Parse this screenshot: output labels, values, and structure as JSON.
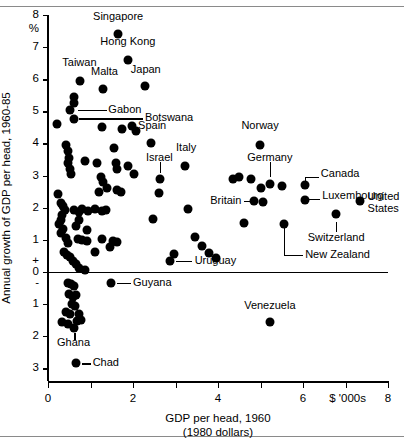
{
  "chart_data": {
    "type": "scatter",
    "title": "",
    "xlabel": "GDP per head, 1960",
    "xlabel_sub": "(1980 dollars)",
    "ylabel": "Annual growth of GDP per head, 1960-85",
    "y_unit": "%",
    "x_unit": "$ '000s",
    "xlim": [
      0,
      8
    ],
    "ylim": [
      -3.4,
      8
    ],
    "xticks": [
      0,
      1,
      2,
      3,
      4,
      5,
      6,
      7,
      8
    ],
    "xtick_labels": [
      "0",
      "",
      "2",
      "",
      "4",
      "",
      "6",
      "",
      "8"
    ],
    "yticks": [
      8,
      7,
      6,
      5,
      4,
      3,
      2,
      1,
      0.35,
      0,
      -0.35,
      -1,
      -2,
      -3
    ],
    "ytick_labels": [
      "8",
      "7",
      "6",
      "5",
      "4",
      "3",
      "2",
      "1",
      "+",
      "0",
      "-",
      "1",
      "2",
      "3"
    ],
    "grid": false,
    "legend": null,
    "zero_line": true,
    "labeled_points": [
      {
        "name": "Singapore",
        "x": 1.65,
        "y": 7.4
      },
      {
        "name": "Hong Kong",
        "x": 1.88,
        "y": 6.6
      },
      {
        "name": "Japan",
        "x": 2.28,
        "y": 5.8
      },
      {
        "name": "Taiwan",
        "x": 0.75,
        "y": 5.95
      },
      {
        "name": "Malta",
        "x": 1.3,
        "y": 5.7
      },
      {
        "name": "Gabon",
        "x": 0.52,
        "y": 5.05
      },
      {
        "name": "Botswana",
        "x": 0.6,
        "y": 4.75
      },
      {
        "name": "Spain",
        "x": 2.42,
        "y": 4.0
      },
      {
        "name": "Israel",
        "x": 2.64,
        "y": 2.9
      },
      {
        "name": "Italy",
        "x": 3.22,
        "y": 3.3
      },
      {
        "name": "Norway",
        "x": 4.99,
        "y": 3.95
      },
      {
        "name": "Germany",
        "x": 5.22,
        "y": 2.75
      },
      {
        "name": "Britain",
        "x": 4.85,
        "y": 2.2
      },
      {
        "name": "Canada",
        "x": 6.05,
        "y": 2.72
      },
      {
        "name": "Luxembourg",
        "x": 6.05,
        "y": 2.25
      },
      {
        "name": "United States",
        "x": 7.34,
        "y": 2.2
      },
      {
        "name": "Switzerland",
        "x": 6.78,
        "y": 1.8
      },
      {
        "name": "New Zealand",
        "x": 5.55,
        "y": 1.5
      },
      {
        "name": "Uruguay",
        "x": 2.87,
        "y": 0.35
      },
      {
        "name": "Guyana",
        "x": 1.48,
        "y": -0.35
      },
      {
        "name": "Ghana",
        "x": 0.62,
        "y": -1.75
      },
      {
        "name": "Chad",
        "x": 0.65,
        "y": -2.85
      },
      {
        "name": "Venezuela",
        "x": 5.22,
        "y": -1.55
      }
    ],
    "unlabeled_points": [
      {
        "x": 0.62,
        "y": 5.45
      },
      {
        "x": 0.6,
        "y": 5.25
      },
      {
        "x": 0.22,
        "y": 4.6
      },
      {
        "x": 1.27,
        "y": 4.5
      },
      {
        "x": 1.73,
        "y": 4.45
      },
      {
        "x": 1.97,
        "y": 4.55
      },
      {
        "x": 2.06,
        "y": 4.4
      },
      {
        "x": 0.42,
        "y": 3.95
      },
      {
        "x": 0.46,
        "y": 3.75
      },
      {
        "x": 0.5,
        "y": 3.55
      },
      {
        "x": 0.46,
        "y": 3.38
      },
      {
        "x": 0.52,
        "y": 3.2
      },
      {
        "x": 0.55,
        "y": 3.05
      },
      {
        "x": 0.86,
        "y": 3.45
      },
      {
        "x": 1.55,
        "y": 3.85
      },
      {
        "x": 1.6,
        "y": 3.4
      },
      {
        "x": 1.63,
        "y": 3.2
      },
      {
        "x": 1.88,
        "y": 3.3
      },
      {
        "x": 2.03,
        "y": 3.05
      },
      {
        "x": 1.16,
        "y": 3.4
      },
      {
        "x": 1.25,
        "y": 2.95
      },
      {
        "x": 1.3,
        "y": 2.8
      },
      {
        "x": 1.38,
        "y": 2.62
      },
      {
        "x": 1.2,
        "y": 2.5
      },
      {
        "x": 1.62,
        "y": 2.55
      },
      {
        "x": 1.72,
        "y": 2.5
      },
      {
        "x": 0.24,
        "y": 2.42
      },
      {
        "x": 0.3,
        "y": 2.15
      },
      {
        "x": 0.36,
        "y": 2.05
      },
      {
        "x": 0.4,
        "y": 1.92
      },
      {
        "x": 0.33,
        "y": 1.78
      },
      {
        "x": 0.3,
        "y": 1.62
      },
      {
        "x": 0.27,
        "y": 1.48
      },
      {
        "x": 0.36,
        "y": 1.35
      },
      {
        "x": 0.3,
        "y": 1.2
      },
      {
        "x": 0.42,
        "y": 1.05
      },
      {
        "x": 0.46,
        "y": 0.9
      },
      {
        "x": 0.38,
        "y": 0.62
      },
      {
        "x": 0.44,
        "y": 0.52
      },
      {
        "x": 0.52,
        "y": 0.45
      },
      {
        "x": 0.58,
        "y": 0.35
      },
      {
        "x": 0.66,
        "y": 0.25
      },
      {
        "x": 0.74,
        "y": 0.12
      },
      {
        "x": 0.86,
        "y": 0.05
      },
      {
        "x": 0.62,
        "y": 1.92
      },
      {
        "x": 0.72,
        "y": 1.85
      },
      {
        "x": 0.8,
        "y": 1.95
      },
      {
        "x": 0.94,
        "y": 1.88
      },
      {
        "x": 1.1,
        "y": 1.95
      },
      {
        "x": 1.26,
        "y": 1.88
      },
      {
        "x": 1.36,
        "y": 1.92
      },
      {
        "x": 0.72,
        "y": 1.62
      },
      {
        "x": 0.66,
        "y": 1.42
      },
      {
        "x": 0.92,
        "y": 1.3
      },
      {
        "x": 0.7,
        "y": 1.02
      },
      {
        "x": 0.8,
        "y": 0.98
      },
      {
        "x": 0.92,
        "y": 0.95
      },
      {
        "x": 1.1,
        "y": 0.62
      },
      {
        "x": 1.28,
        "y": 1.02
      },
      {
        "x": 1.46,
        "y": 0.78
      },
      {
        "x": 1.52,
        "y": 0.95
      },
      {
        "x": 1.62,
        "y": 0.92
      },
      {
        "x": 2.6,
        "y": 2.45
      },
      {
        "x": 3.3,
        "y": 1.95
      },
      {
        "x": 2.46,
        "y": 1.65
      },
      {
        "x": 2.96,
        "y": 0.55
      },
      {
        "x": 3.45,
        "y": 1.08
      },
      {
        "x": 3.62,
        "y": 0.82
      },
      {
        "x": 3.78,
        "y": 0.58
      },
      {
        "x": 3.95,
        "y": 0.42
      },
      {
        "x": 4.35,
        "y": 2.9
      },
      {
        "x": 4.5,
        "y": 2.95
      },
      {
        "x": 4.78,
        "y": 2.88
      },
      {
        "x": 5.02,
        "y": 2.62
      },
      {
        "x": 5.5,
        "y": 2.68
      },
      {
        "x": 5.05,
        "y": 2.18
      },
      {
        "x": 4.62,
        "y": 1.52
      },
      {
        "x": 0.46,
        "y": -0.35
      },
      {
        "x": 0.54,
        "y": -0.38
      },
      {
        "x": 0.62,
        "y": -0.45
      },
      {
        "x": 0.5,
        "y": -0.7
      },
      {
        "x": 0.58,
        "y": -0.78
      },
      {
        "x": 0.66,
        "y": -0.72
      },
      {
        "x": 0.56,
        "y": -1.0
      },
      {
        "x": 0.64,
        "y": -1.05
      },
      {
        "x": 0.42,
        "y": -1.25
      },
      {
        "x": 0.52,
        "y": -1.32
      },
      {
        "x": 0.72,
        "y": -1.3
      },
      {
        "x": 0.34,
        "y": -1.55
      },
      {
        "x": 0.46,
        "y": -1.62
      },
      {
        "x": 0.68,
        "y": -1.52
      },
      {
        "x": 0.78,
        "y": -1.5
      }
    ]
  },
  "labels": {
    "Singapore": {
      "text": "Singapore",
      "lx": 1.65,
      "ly": 7.95,
      "anchor": "center"
    },
    "Hong Kong": {
      "text": "Hong Kong",
      "lx": 1.88,
      "ly": 7.15,
      "anchor": "center"
    },
    "Japan": {
      "text": "Japan",
      "lx": 2.3,
      "ly": 6.3,
      "anchor": "center"
    },
    "Taiwan": {
      "text": "Taiwan",
      "lx": 0.74,
      "ly": 6.52,
      "anchor": "center"
    },
    "Malta": {
      "text": "Malta",
      "lx": 1.33,
      "ly": 6.22,
      "anchor": "center"
    },
    "Gabon": {
      "text": "Gabon",
      "lx": 1.42,
      "ly": 5.05,
      "anchor": "left"
    },
    "Botswana": {
      "text": "Botswana",
      "lx": 2.28,
      "ly": 4.78,
      "anchor": "left"
    },
    "Spain": {
      "text": "Spain",
      "lx": 2.45,
      "ly": 4.55,
      "anchor": "center"
    },
    "Israel": {
      "text": "Israel",
      "lx": 2.62,
      "ly": 3.55,
      "anchor": "center"
    },
    "Italy": {
      "text": "Italy",
      "lx": 3.25,
      "ly": 3.85,
      "anchor": "center"
    },
    "Norway": {
      "text": "Norway",
      "lx": 4.99,
      "ly": 4.55,
      "anchor": "center"
    },
    "Germany": {
      "text": "Germany",
      "lx": 5.22,
      "ly": 3.55,
      "anchor": "center"
    },
    "Britain": {
      "text": "Britain",
      "lx": 4.55,
      "ly": 2.2,
      "anchor": "right"
    },
    "Canada": {
      "text": "Canada",
      "lx": 6.42,
      "ly": 3.05,
      "anchor": "left"
    },
    "Luxembourg": {
      "text": "Luxembourg",
      "lx": 6.45,
      "ly": 2.35,
      "anchor": "left"
    },
    "United States": {
      "text": "United\nStates",
      "lx": 7.52,
      "ly": 2.32,
      "anchor": "left"
    },
    "Switzerland": {
      "text": "Switzerland",
      "lx": 6.78,
      "ly": 1.05,
      "anchor": "center"
    },
    "New Zealand": {
      "text": "New Zealand",
      "lx": 6.05,
      "ly": 0.52,
      "anchor": "left"
    },
    "Uruguay": {
      "text": "Uruguay",
      "lx": 3.45,
      "ly": 0.35,
      "anchor": "left"
    },
    "Guyana": {
      "text": "Guyana",
      "lx": 2.0,
      "ly": -0.35,
      "anchor": "left"
    },
    "Ghana": {
      "text": "Ghana",
      "lx": 0.6,
      "ly": -2.22,
      "anchor": "center"
    },
    "Chad": {
      "text": "Chad",
      "lx": 1.05,
      "ly": -2.85,
      "anchor": "left"
    },
    "Venezuela": {
      "text": "Venezuela",
      "lx": 5.22,
      "ly": -1.05,
      "anchor": "center"
    }
  }
}
